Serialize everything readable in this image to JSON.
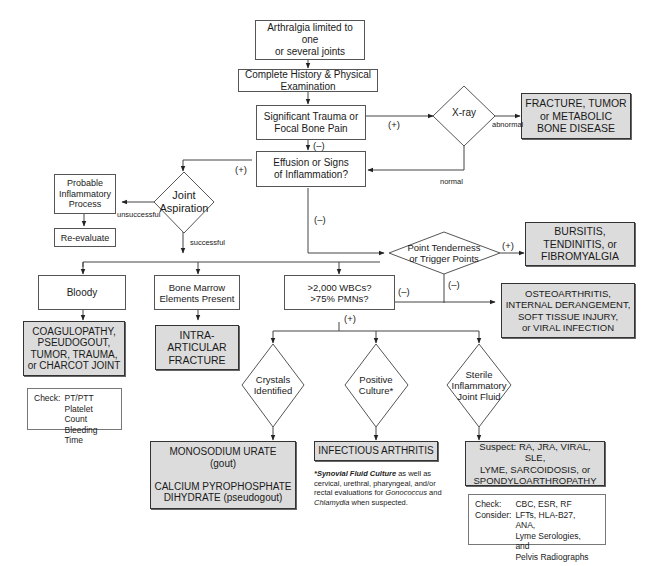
{
  "flowchart": {
    "start": "Arthralgia limited to one\nor several joints",
    "history": "Complete History & Physical Examination",
    "trauma": "Significant Trauma or\nFocal Bone Pain",
    "xray": "X-ray",
    "fracture_result": "FRACTURE, TUMOR\nor METABOLIC\nBONE DISEASE",
    "effusion": "Effusion or Signs\nof Inflammation?",
    "joint_aspiration": "Joint\nAspiration",
    "probable_inflammatory": "Probable\nInflammatory\nProcess",
    "reevaluate": "Re-evaluate",
    "point_tenderness": "Point Tenderness\nor Trigger Points",
    "bursitis_result": "BURSITIS,\nTENDINITIS, or\nFIBROMYALGIA",
    "bloody": "Bloody",
    "bone_marrow": "Bone Marrow\nElements Present",
    "wbc": ">2,000 WBCs?\n>75% PMNs?",
    "osteo_result": "OSTEOARTHRITIS,\nINTERNAL DERANGEMENT,\nSOFT TISSUE INJURY,\nor VIRAL INFECTION",
    "coag_result": "COAGULOPATHY,\nPSEUDOGOUT,\nTUMOR, TRAUMA,\nor CHARCOT JOINT",
    "intra_result": "INTRA-\nARTICULAR\nFRACTURE",
    "crystals": "Crystals\nIdentified",
    "positive_culture": "Positive\nCulture*",
    "sterile": "Sterile\nInflammatory\nJoint Fluid",
    "crystal_result": "MONOSODIUM URATE\n(gout)\n\nCALCIUM PYROPHOSPHATE\nDIHYDRATE (pseudogout)",
    "infectious_result": "INFECTIOUS ARTHRITIS",
    "suspect_result": "Suspect:  RA, JRA, VIRAL, SLE,\nLYME, SARCOIDOSIS, or\nSPONDYLOARTHROPATHY"
  },
  "edge_labels": {
    "plus": "(+)",
    "minus": "(–)",
    "abnormal": "abnormal",
    "normal": "normal",
    "unsuccessful": "unsuccessful",
    "successful": "successful"
  },
  "check_bloody": {
    "label": "Check:",
    "items": "PT/PTT\nPlatelet Count\nBleeding Time"
  },
  "check_sterile": {
    "check_label": "Check:",
    "check_items": "CBC, ESR, RF",
    "consider_label": "Consider:",
    "consider_items": "LFTs, HLA-B27, ANA,\nLyme Serologies, and\nPelvis Radiographs"
  },
  "footnote": {
    "bold": "*Synovial Fluid Culture",
    "text1": " as well as cervical, urethral, pharyngeal, and/or rectal evaluations for ",
    "italic1": "Gonococcus",
    "text2": " and ",
    "italic2": "Chlamydia",
    "text3": " when suspected."
  }
}
